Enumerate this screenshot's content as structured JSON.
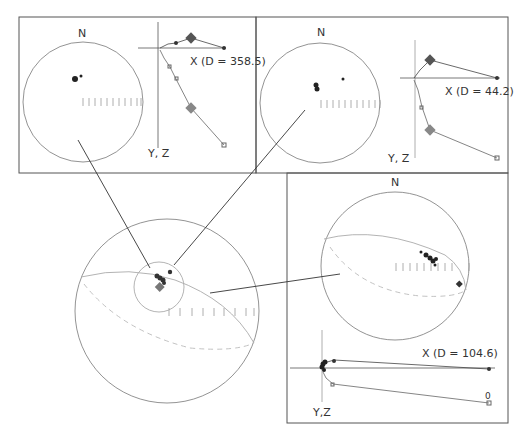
{
  "colors": {
    "frame": "#444444",
    "circle": "#777777",
    "great_circle": "#aaaaaa",
    "connector": "#333333",
    "points": "#222222",
    "diamond": "#666666"
  },
  "panels": {
    "top_left": {
      "north_label": "N",
      "x_axis_label": "X (D = 358.5)",
      "yz_axis_label": "Y, Z"
    },
    "top_right": {
      "north_label": "N",
      "x_axis_label": "X (D = 44.2)",
      "yz_axis_label": "Y, Z"
    },
    "bottom_right": {
      "north_label": "N",
      "x_axis_label": "X (D = 104.6)",
      "yz_axis_label": "Y,Z",
      "origin_label": "0"
    }
  }
}
